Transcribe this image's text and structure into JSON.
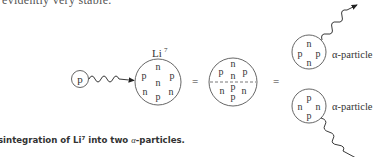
{
  "top_text": "evidently very stable.",
  "figure": {
    "incoming_particle": {
      "label": "p"
    },
    "lithium_nucleus": {
      "label": "Li",
      "superscript": "7",
      "nucleons": [
        "n",
        "p",
        "p",
        "n",
        "n",
        "n",
        "p"
      ]
    },
    "equals_1": "=",
    "split_nucleus": {
      "top_half": [
        "n",
        "p",
        "n",
        "p"
      ],
      "bottom_half": [
        "p",
        "n",
        "n",
        "p"
      ]
    },
    "equals_2": "=",
    "alpha_top": {
      "nucleons": [
        "n",
        "p",
        "p",
        "n"
      ],
      "label": "α-particle"
    },
    "alpha_bottom": {
      "nucleons": [
        "p",
        "n",
        "n",
        "p"
      ],
      "label": "α-particle"
    }
  },
  "caption": {
    "prefix": "sintegration of Li",
    "superscript": "7",
    "middle": " into two ",
    "alpha": "α",
    "suffix": "-particles."
  }
}
